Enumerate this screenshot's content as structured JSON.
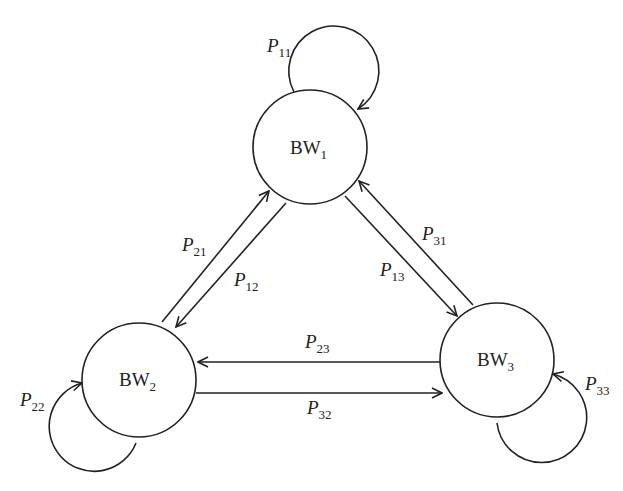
{
  "diagram": {
    "type": "state-transition",
    "nodes": [
      {
        "id": "BW1",
        "base": "BW",
        "sub": "1",
        "cx": 310,
        "cy": 147,
        "r": 57
      },
      {
        "id": "BW2",
        "base": "BW",
        "sub": "2",
        "cx": 139,
        "cy": 380,
        "r": 57
      },
      {
        "id": "BW3",
        "base": "BW",
        "sub": "3",
        "cx": 497,
        "cy": 360,
        "r": 57
      }
    ],
    "edges": [
      {
        "from": "BW1",
        "to": "BW1",
        "base": "P",
        "sub": "11"
      },
      {
        "from": "BW2",
        "to": "BW2",
        "base": "P",
        "sub": "22"
      },
      {
        "from": "BW3",
        "to": "BW3",
        "base": "P",
        "sub": "33"
      },
      {
        "from": "BW2",
        "to": "BW1",
        "base": "P",
        "sub": "21"
      },
      {
        "from": "BW1",
        "to": "BW2",
        "base": "P",
        "sub": "12"
      },
      {
        "from": "BW3",
        "to": "BW1",
        "base": "P",
        "sub": "31"
      },
      {
        "from": "BW1",
        "to": "BW3",
        "base": "P",
        "sub": "13"
      },
      {
        "from": "BW3",
        "to": "BW2",
        "base": "P",
        "sub": "23"
      },
      {
        "from": "BW2",
        "to": "BW3",
        "base": "P",
        "sub": "32"
      }
    ]
  }
}
